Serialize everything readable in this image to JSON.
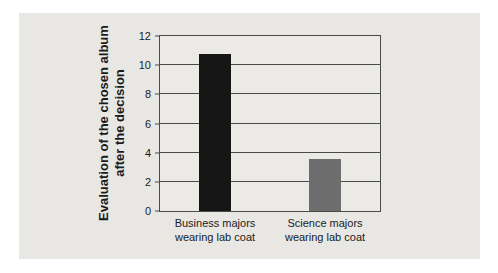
{
  "figure": {
    "ylabel": "Evaluation of the chosen album\nafter the decision"
  },
  "chart_data": {
    "type": "bar",
    "title": "",
    "xlabel": "",
    "ylabel": "Evaluation of the chosen album after the decision",
    "categories": [
      "Business majors\nwearing lab coat",
      "Science majors\nwearing lab coat"
    ],
    "values": [
      10.8,
      3.6
    ],
    "bar_colors": [
      "#161616",
      "#6d6d6d"
    ],
    "ylim": [
      0,
      12
    ],
    "yticks": [
      0,
      2,
      4,
      6,
      8,
      10,
      12
    ],
    "grid": "horizontal",
    "legend_position": "none",
    "card_background": "#e8e7e3",
    "plot_background": "#eceae7",
    "grid_color": "#4a4a4a",
    "bar_width_px": 32
  }
}
